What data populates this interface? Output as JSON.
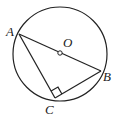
{
  "diagram": {
    "points": {
      "A": {
        "label": "A"
      },
      "B": {
        "label": "B"
      },
      "C": {
        "label": "C"
      },
      "O": {
        "label": "O"
      }
    },
    "segments": [
      "AB",
      "AC",
      "BC"
    ],
    "right_angle_at": "C",
    "center": "O"
  }
}
